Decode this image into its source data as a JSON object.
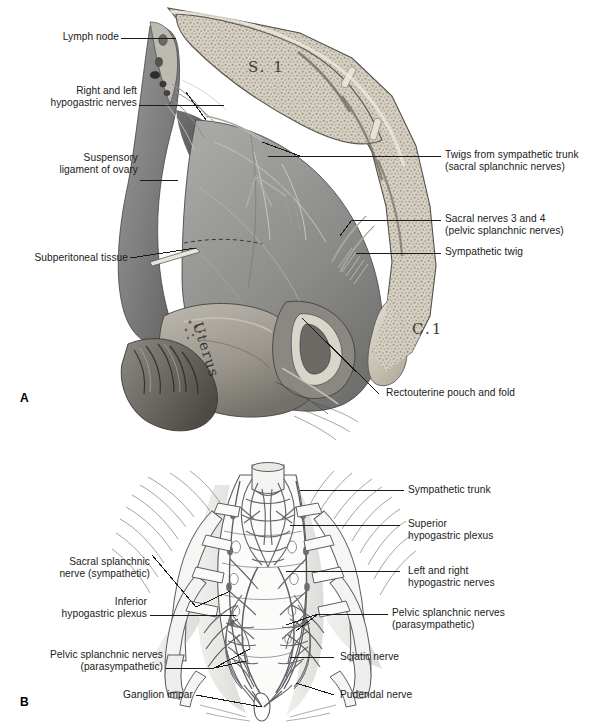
{
  "figure": {
    "panels": [
      {
        "id": "A",
        "letter": "A"
      },
      {
        "id": "B",
        "letter": "B"
      }
    ]
  },
  "panel_a": {
    "letter": "A",
    "art_labels": [
      {
        "name": "sacral-vertebra-1",
        "text": "S. 1"
      },
      {
        "name": "coccyx-1",
        "text": "C.1"
      },
      {
        "name": "uterus",
        "text": "Uterus"
      }
    ],
    "labels": [
      {
        "name": "lymph-node",
        "text": "Lymph node",
        "align": "right"
      },
      {
        "name": "right-and-left-hypogastric-nerves",
        "text": "Right and left\nhypogastric nerves",
        "align": "right"
      },
      {
        "name": "suspensory-ligament-of-ovary",
        "text": "Suspensory\nligament of ovary",
        "align": "right"
      },
      {
        "name": "subperitoneal-tissue",
        "text": "Subperitoneal tissue",
        "align": "right"
      },
      {
        "name": "twigs-from-sympathetic-trunk",
        "text": "Twigs from sympathetic trunk\n(sacral splanchnic nerves)",
        "align": "left"
      },
      {
        "name": "sacral-nerves-3-and-4",
        "text": "Sacral nerves 3 and 4\n(pelvic splanchnic nerves)",
        "align": "left"
      },
      {
        "name": "sympathetic-twig",
        "text": "Sympathetic twig",
        "align": "left"
      },
      {
        "name": "rectouterine-pouch-and-fold",
        "text": "Rectouterine pouch and fold",
        "align": "left"
      }
    ]
  },
  "panel_b": {
    "letter": "B",
    "labels": [
      {
        "name": "sympathetic-trunk",
        "text": "Sympathetic trunk",
        "align": "left"
      },
      {
        "name": "superior-hypogastric-plexus",
        "text": "Superior\nhypogastric plexus",
        "align": "left"
      },
      {
        "name": "left-and-right-hypogastric-nerves",
        "text": "Left and right\nhypogastric nerves",
        "align": "left"
      },
      {
        "name": "pelvic-splanchnic-nerves-right",
        "text": "Pelvic splanchnic nerves\n(parasympathetic)",
        "align": "left"
      },
      {
        "name": "sciatic-nerve",
        "text": "Sciatic nerve",
        "align": "left"
      },
      {
        "name": "pudendal-nerve",
        "text": "Pudendal nerve",
        "align": "left"
      },
      {
        "name": "sacral-splanchnic-nerve",
        "text": "Sacral splanchnic\nnerve (sympathetic)",
        "align": "right"
      },
      {
        "name": "inferior-hypogastric-plexus",
        "text": "Inferior\nhypogastric plexus",
        "align": "right"
      },
      {
        "name": "pelvic-splanchnic-nerves-left",
        "text": "Pelvic splanchnic nerves\n(parasympathetic)",
        "align": "right"
      },
      {
        "name": "ganglion-impar",
        "text": "Ganglion impar",
        "align": "right"
      }
    ]
  },
  "colors": {
    "page_background": "#ffffff",
    "text": "#1a1a1a",
    "leader_line": "#1a1a1a",
    "tissue_mid": "#8a8a8a",
    "tissue_dark": "#4a4a4a",
    "tissue_light": "#c9c4ba",
    "bone_light": "#d8d3c8",
    "line_art": "#55565a",
    "nerve_art": "#6a6a70"
  }
}
